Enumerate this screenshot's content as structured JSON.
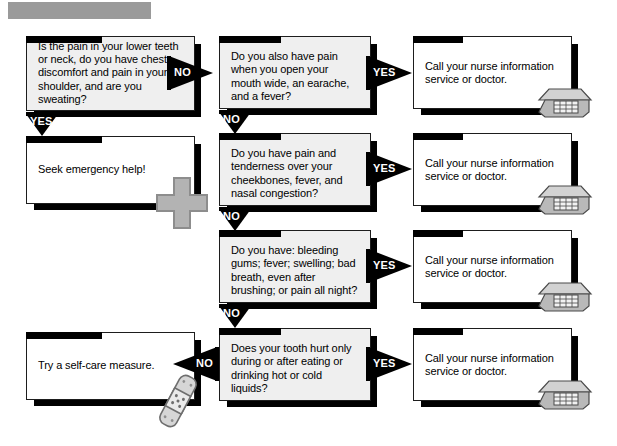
{
  "document": {
    "type": "medical-symptom-flowchart",
    "title_bar": "",
    "page_background": "#ffffff"
  },
  "colors": {
    "box_outline": "#1d1d1d",
    "box_shadow": "#000000",
    "question_fill": "#efefef",
    "answer_fill": "#ffffff",
    "flag_fill": "#000000",
    "flag_text": "#ffffff",
    "clipart_gray": "#b0b0b0",
    "title_bar_gray": "#9a9a9a"
  },
  "nodes": {
    "q1": {
      "id": "question-1",
      "kind": "question",
      "text": "Is the pain in your lower teeth or neck, do you have chest discomfort and pain in your shoulder, and are you sweating?"
    },
    "q2": {
      "id": "question-2",
      "kind": "question",
      "text": "Do you also have pain when you open your mouth wide, an earache, and a fever?"
    },
    "q3": {
      "id": "question-3",
      "kind": "question",
      "text": "Do you have pain and tenderness over your cheekbones, fever, and nasal congestion?"
    },
    "q4": {
      "id": "question-4",
      "kind": "question",
      "text": "Do you have: bleeding gums; fever; swelling; bad breath, even after brushing; or pain all night?"
    },
    "q5": {
      "id": "question-5",
      "kind": "question",
      "text": "Does your tooth hurt only during or after eating or drinking hot or cold liquids?"
    },
    "a_emergency": {
      "id": "answer-emergency",
      "kind": "answer",
      "text": "Seek emergency help!",
      "icon": "medical-cross-icon"
    },
    "a_call_1": {
      "id": "answer-call-1",
      "kind": "answer",
      "text": "Call your nurse information service or doctor.",
      "icon": "telephone-icon"
    },
    "a_call_2": {
      "id": "answer-call-2",
      "kind": "answer",
      "text": "Call your nurse information service or doctor.",
      "icon": "telephone-icon"
    },
    "a_call_3": {
      "id": "answer-call-3",
      "kind": "answer",
      "text": "Call your nurse information service or doctor.",
      "icon": "telephone-icon"
    },
    "a_call_4": {
      "id": "answer-call-4",
      "kind": "answer",
      "text": "Call your nurse information service or doctor.",
      "icon": "telephone-icon"
    },
    "a_selfcare": {
      "id": "answer-self-care",
      "kind": "answer",
      "text": "Try a self-care measure.",
      "icon": "bandage-icon"
    }
  },
  "connectors": {
    "q1_no": {
      "label": "NO",
      "from": "q1",
      "to": "q2",
      "direction": "right"
    },
    "q1_yes": {
      "label": "YES",
      "from": "q1",
      "to": "a_emergency",
      "direction": "down"
    },
    "q2_yes": {
      "label": "YES",
      "from": "q2",
      "to": "a_call_1",
      "direction": "right"
    },
    "q2_no": {
      "label": "NO",
      "from": "q2",
      "to": "q3",
      "direction": "down"
    },
    "q3_yes": {
      "label": "YES",
      "from": "q3",
      "to": "a_call_2",
      "direction": "right"
    },
    "q3_no": {
      "label": "NO",
      "from": "q3",
      "to": "q4",
      "direction": "down"
    },
    "q4_yes": {
      "label": "YES",
      "from": "q4",
      "to": "a_call_3",
      "direction": "right"
    },
    "q4_no": {
      "label": "NO",
      "from": "q4",
      "to": "q5",
      "direction": "down"
    },
    "q5_yes": {
      "label": "YES",
      "from": "q5",
      "to": "a_call_4",
      "direction": "right"
    },
    "q5_no": {
      "label": "NO",
      "from": "q5",
      "to": "a_selfcare",
      "direction": "left"
    }
  }
}
